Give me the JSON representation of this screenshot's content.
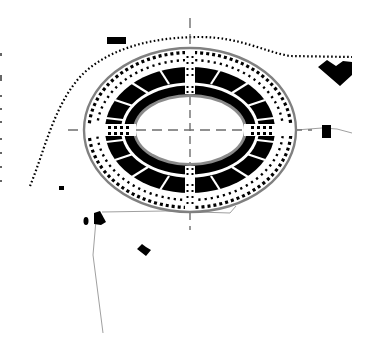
{
  "drawing": {
    "type": "architectural site plan",
    "subject": "elliptical amphitheater",
    "colors": {
      "background": "#ffffff",
      "fill": "#000000",
      "outline": "#808080",
      "axis": "#6e6e6e",
      "path": "#a0a0a0"
    },
    "amphitheater": {
      "center": [
        190,
        130
      ],
      "outer_ellipse": {
        "rx": 106,
        "ry": 82
      },
      "outer_dot_ring": {
        "rx": 100,
        "ry": 77
      },
      "inner_dot_ring": {
        "rx": 92,
        "ry": 70
      },
      "seating_outer": {
        "rx": 85,
        "ry": 63
      },
      "seating_divider": {
        "rx": 69,
        "ry": 47
      },
      "arena": {
        "rx": 56,
        "ry": 35
      },
      "radial_sectors": 24,
      "entrances": [
        "north",
        "south",
        "east",
        "west"
      ]
    },
    "axes": {
      "horizontal": {
        "y": 130,
        "x1": 68,
        "x2": 312
      },
      "vertical": {
        "x": 190,
        "y1": 18,
        "y2": 228
      }
    },
    "boundary_dotted_line": "curved dotted boundary arcing over the amphitheater from lower-left to the right edge",
    "buildings": [
      {
        "name": "building-north-west",
        "shape": "rect"
      },
      {
        "name": "building-north-east",
        "shape": "chevron"
      },
      {
        "name": "building-east",
        "shape": "rect"
      },
      {
        "name": "building-south-west-a",
        "shape": "small-rect"
      },
      {
        "name": "building-south-west-b",
        "shape": "irregular"
      },
      {
        "name": "building-south-west-c",
        "shape": "small-oval"
      },
      {
        "name": "building-south",
        "shape": "diamond"
      },
      {
        "name": "building-west-small",
        "shape": "small-square"
      }
    ],
    "paths": [
      "road running south from south-west building cluster",
      "path from south-west cluster to amphitheater south side",
      "path from amphitheater east to east building and beyond"
    ]
  }
}
